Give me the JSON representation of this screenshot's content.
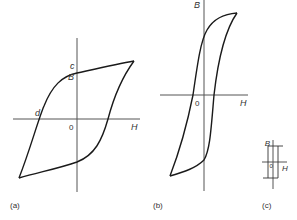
{
  "figure": {
    "panels": [
      {
        "id": "a",
        "caption": "(a)",
        "axis_labels": {
          "vertical": "B",
          "horizontal": "H",
          "origin": "0"
        },
        "point_labels": [
          {
            "name": "c",
            "meaning": "remanence"
          },
          {
            "name": "d",
            "meaning": "coercivity"
          }
        ],
        "shape": "broad S-shaped loop"
      },
      {
        "id": "b",
        "caption": "(b)",
        "axis_labels": {
          "vertical": "B",
          "horizontal": "H",
          "origin": "0"
        },
        "shape": "tall narrow loop"
      },
      {
        "id": "c",
        "caption": "(c)",
        "axis_labels": {
          "vertical": "B",
          "horizontal": "H",
          "origin": "0"
        },
        "shape": "very narrow rectangular loop"
      }
    ]
  },
  "labels": {
    "a_B": "B",
    "a_H": "H",
    "a_0": "0",
    "a_c": "c",
    "a_d": "d",
    "a_caption": "(a)",
    "b_B": "B",
    "b_H": "H",
    "b_0": "0",
    "b_caption": "(b)",
    "c_B": "B",
    "c_H": "H",
    "c_0": "0",
    "c_caption": "(c)"
  },
  "colors": {
    "curve": "#1a1a1a",
    "axis": "#555555",
    "text": "#333333",
    "background": "#ffffff"
  }
}
